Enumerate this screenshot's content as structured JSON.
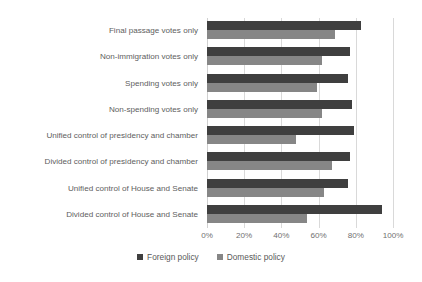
{
  "chart_data": {
    "type": "bar",
    "orientation": "horizontal",
    "title": "",
    "xlabel": "",
    "ylabel": "",
    "xlim": [
      0,
      100
    ],
    "xticks": [
      "0%",
      "20%",
      "40%",
      "60%",
      "80%",
      "100%"
    ],
    "xtick_values": [
      0,
      20,
      40,
      60,
      80,
      100
    ],
    "grid": true,
    "legend_position": "bottom",
    "categories": [
      "Final passage votes only",
      "Non-immigration votes only",
      "Spending votes only",
      "Non-spending votes only",
      "Unified control of presidency and chamber",
      "Divided control of presidency and chamber",
      "Unified control of House and Senate",
      "Divided control of House and Senate"
    ],
    "series": [
      {
        "name": "Foreign policy",
        "color": "#3f3f3f",
        "values": [
          83,
          77,
          76,
          78,
          79,
          77,
          76,
          94
        ]
      },
      {
        "name": "Domestic policy",
        "color": "#868686",
        "values": [
          69,
          62,
          59,
          62,
          48,
          67,
          63,
          54
        ]
      }
    ]
  }
}
